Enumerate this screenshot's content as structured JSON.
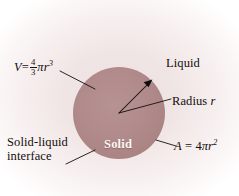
{
  "figure": {
    "name": "sphere-solid-liquid-diagram",
    "width": 239,
    "height": 196,
    "background_color": "#ffffff",
    "vignette_inner_color": "#efe3e3",
    "vignette_outer_color": "#ffffff"
  },
  "sphere": {
    "label": "Solid",
    "fill_color": "#b08b8b",
    "center_x": 119,
    "center_y": 113,
    "radius": 46
  },
  "labels": {
    "volume": {
      "prefix": "V",
      "equals": "=",
      "fraction_numerator": "4",
      "fraction_denominator": "3",
      "pi": "π",
      "variable": "r",
      "exponent": "3",
      "full_text": "V = 4/3 πr³"
    },
    "area": {
      "prefix": "A",
      "equals": "=",
      "coefficient": "4",
      "pi": "π",
      "variable": "r",
      "exponent": "2",
      "full_text": "A = 4πr²"
    },
    "liquid": "Liquid",
    "radius": {
      "text": "Radius",
      "variable": "r"
    },
    "interface_line1": "Solid-liquid",
    "interface_line2": "interface"
  },
  "annotations": {
    "leader_line_color": "#140d0d",
    "radius_arrow_color": "#140d0d",
    "text_color": "#140d0d",
    "solid_text_color": "#fdf6f4"
  }
}
